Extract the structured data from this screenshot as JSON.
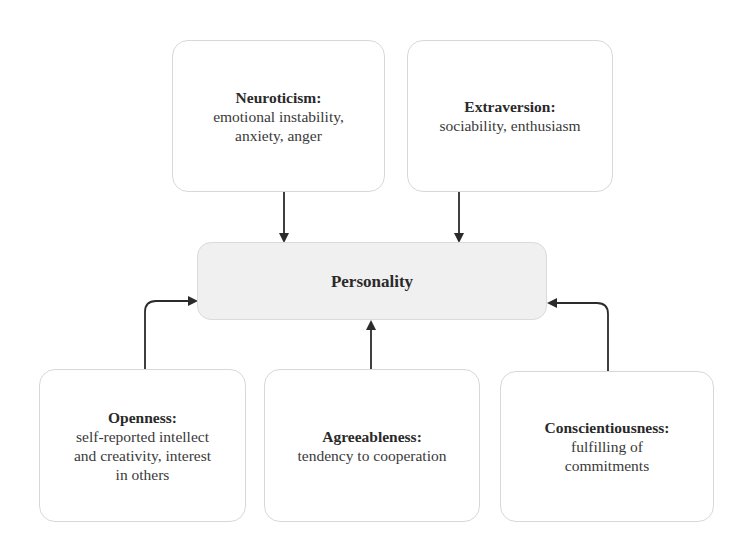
{
  "diagram": {
    "center": {
      "label": "Personality"
    },
    "traits": [
      {
        "id": "neuroticism",
        "title": "Neuroticism:",
        "description_lines": [
          "emotional instability,",
          "anxiety, anger"
        ]
      },
      {
        "id": "extraversion",
        "title": "Extraversion:",
        "description_lines": [
          "sociability, enthusiasm"
        ]
      },
      {
        "id": "openness",
        "title": "Openness:",
        "description_lines": [
          "self-reported intellect",
          "and creativity, interest",
          "in others"
        ]
      },
      {
        "id": "agreeableness",
        "title": "Agreeableness:",
        "description_lines": [
          "tendency to cooperation"
        ]
      },
      {
        "id": "conscientiousness",
        "title": "Conscientiousness:",
        "description_lines": [
          "fulfilling of",
          "commitments"
        ]
      }
    ],
    "edges": [
      {
        "from": "neuroticism",
        "to": "Personality"
      },
      {
        "from": "extraversion",
        "to": "Personality"
      },
      {
        "from": "openness",
        "to": "Personality"
      },
      {
        "from": "agreeableness",
        "to": "Personality"
      },
      {
        "from": "conscientiousness",
        "to": "Personality"
      }
    ],
    "colors": {
      "box_border": "#d8d8d8",
      "center_fill": "#f0f0f0",
      "arrow": "#2b2b2b"
    }
  }
}
